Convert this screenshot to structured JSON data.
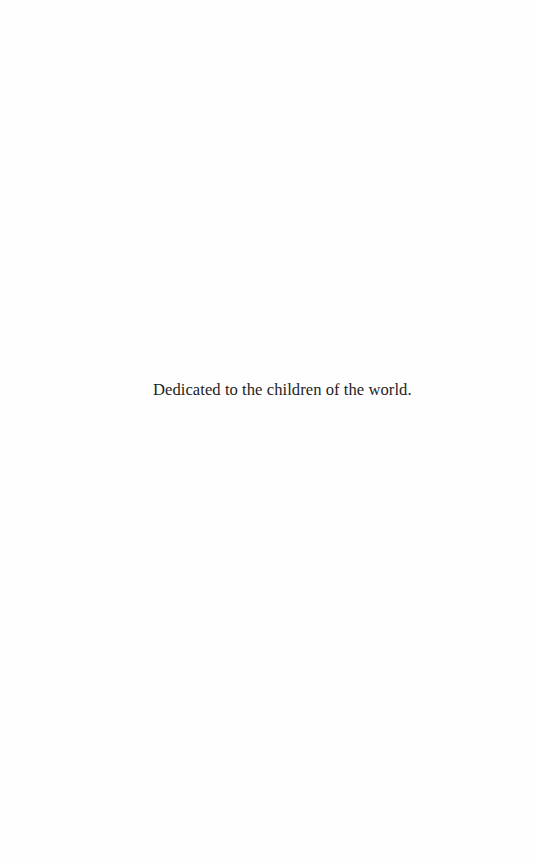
{
  "page": {
    "dedication": "Dedicated to the children of the world."
  },
  "colors": {
    "background": "#fefefe",
    "text": "#1e1e1e"
  }
}
